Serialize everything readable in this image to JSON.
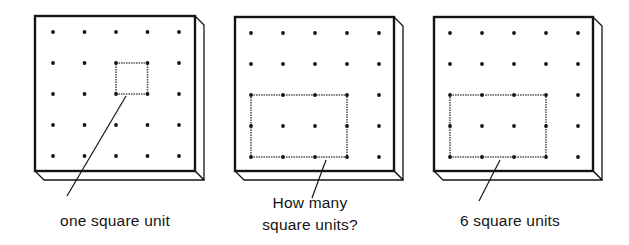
{
  "figure": {
    "ink_color": "#141414",
    "board_face_color": "#ffffff",
    "grid": {
      "rows": 5,
      "cols": 5
    }
  },
  "boards": [
    {
      "id": "board-1",
      "front": {
        "x": 35,
        "y": 16,
        "w": 160,
        "h": 155
      },
      "depth": 9,
      "dot_origin": {
        "x": 53,
        "y": 32
      },
      "dot_step": {
        "x": 31.5,
        "y": 31
      },
      "shape": {
        "col": 2,
        "row": 1,
        "cols": 1,
        "rows": 1
      },
      "leader": {
        "x1": 126,
        "y1": 96,
        "x2": 67,
        "y2": 196
      },
      "caption": {
        "lines": [
          "one square unit"
        ],
        "cx": 115,
        "top": 210
      }
    },
    {
      "id": "board-2",
      "front": {
        "x": 235,
        "y": 17,
        "w": 159,
        "h": 154
      },
      "depth": 9,
      "dot_origin": {
        "x": 251,
        "y": 33
      },
      "dot_step": {
        "x": 32,
        "y": 31
      },
      "shape": {
        "col": 0,
        "row": 2,
        "cols": 3,
        "rows": 2
      },
      "leader": {
        "x1": 326,
        "y1": 160,
        "x2": 312,
        "y2": 198
      },
      "caption": {
        "lines": [
          "How many",
          "square units?"
        ],
        "cx": 310,
        "top": 192
      }
    },
    {
      "id": "board-3",
      "front": {
        "x": 434,
        "y": 17,
        "w": 159,
        "h": 154
      },
      "depth": 9,
      "dot_origin": {
        "x": 450,
        "y": 33
      },
      "dot_step": {
        "x": 32,
        "y": 31
      },
      "shape": {
        "col": 0,
        "row": 2,
        "cols": 3,
        "rows": 2
      },
      "leader": {
        "x1": 500,
        "y1": 160,
        "x2": 479,
        "y2": 201
      },
      "caption": {
        "lines": [
          "6 square units"
        ],
        "cx": 510,
        "top": 210
      }
    }
  ],
  "captions": {
    "board_1": "one square unit",
    "board_2_line_1": "How many",
    "board_2_line_2": "square units?",
    "board_3": "6 square units"
  }
}
